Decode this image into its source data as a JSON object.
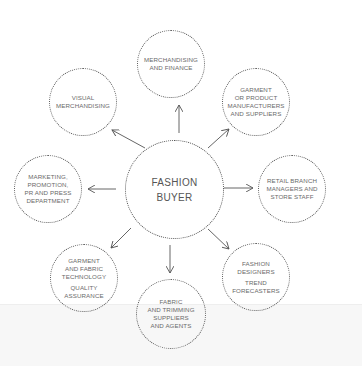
{
  "diagram": {
    "center": {
      "lines": [
        "FASHION",
        "BUYER"
      ]
    },
    "nodes": [
      {
        "id": "merchandising-finance",
        "lines": [
          "MERCHANDISING",
          "AND FINANCE"
        ]
      },
      {
        "id": "visual-merchandising",
        "lines": [
          "VISUAL",
          "MERCHANDISING"
        ]
      },
      {
        "id": "garment-product-manufacturers",
        "lines": [
          "GARMENT",
          "OR PRODUCT",
          "MANUFACTURERS",
          "AND SUPPLIERS"
        ]
      },
      {
        "id": "marketing-promotion-pr",
        "lines": [
          "MARKETING,",
          "PROMOTION,",
          "PR AND PRESS",
          "DEPARTMENT"
        ]
      },
      {
        "id": "retail-branch-managers",
        "lines": [
          "RETAIL BRANCH",
          "MANAGERS AND",
          "STORE STAFF"
        ]
      },
      {
        "id": "garment-fabric-technology",
        "lines": [
          "GARMENT",
          "AND FABRIC",
          "TECHNOLOGY"
        ],
        "lines2": [
          "QUALITY",
          "ASSURANCE"
        ]
      },
      {
        "id": "fashion-designers",
        "lines": [
          "FASHION",
          "DESIGNERS"
        ],
        "lines2": [
          "TREND",
          "FORECASTERS"
        ]
      },
      {
        "id": "fabric-trimming-suppliers",
        "lines": [
          "FABRIC",
          "AND TRIMMING",
          "SUPPLIERS",
          "AND AGENTS"
        ]
      }
    ],
    "colors": {
      "stroke": "#555555",
      "text": "#6a6a6a",
      "background": "#ffffff"
    }
  }
}
